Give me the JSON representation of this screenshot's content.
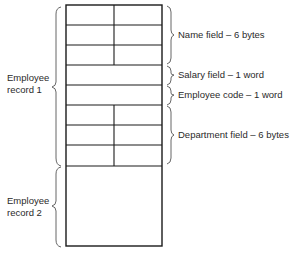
{
  "diagram": {
    "type": "memory-record-layout",
    "colors": {
      "line": "#1a1a1a",
      "text": "#2a2a2a",
      "brace": "#555555",
      "background": "#ffffff"
    },
    "records": [
      {
        "label_line1": "Employee",
        "label_line2": "record 1"
      },
      {
        "label_line1": "Employee",
        "label_line2": "record 2"
      }
    ],
    "fields": [
      {
        "label": "Name field – 6 bytes",
        "rows": 3,
        "split": true
      },
      {
        "label": "Salary field – 1 word",
        "rows": 1,
        "split": false
      },
      {
        "label": "Employee code – 1 word",
        "rows": 1,
        "split": false
      },
      {
        "label": "Department field – 6 bytes",
        "rows": 3,
        "split": true
      }
    ]
  }
}
